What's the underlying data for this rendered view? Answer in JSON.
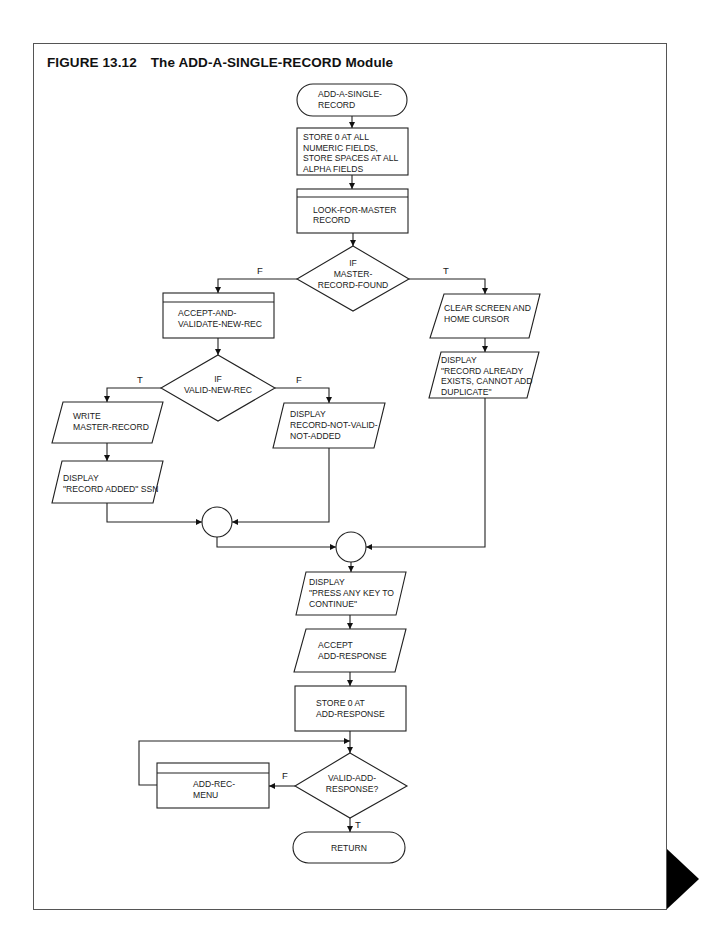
{
  "figure": {
    "number": "FIGURE 13.12",
    "title": "The ADD-A-SINGLE-RECORD Module"
  },
  "flowchart": {
    "start": {
      "type": "terminal",
      "lines": [
        "ADD-A-SINGLE-",
        "RECORD"
      ]
    },
    "init": {
      "type": "process",
      "lines": [
        "STORE 0 AT ALL",
        "NUMERIC  FIELDS,",
        "STORE SPACES AT ALL",
        "ALPHA FIELDS"
      ]
    },
    "look": {
      "type": "predefined-process",
      "lines": [
        "LOOK-FOR-MASTER",
        "RECORD"
      ]
    },
    "found_decision": {
      "type": "decision",
      "lines": [
        "IF",
        "MASTER-",
        "RECORD-FOUND"
      ],
      "false_label": "F",
      "true_label": "T"
    },
    "accept_validate": {
      "type": "predefined-process",
      "lines": [
        "ACCEPT-AND-",
        "VALIDATE-NEW-REC"
      ]
    },
    "clear_screen": {
      "type": "io",
      "lines": [
        "CLEAR SCREEN AND",
        "HOME CURSOR"
      ]
    },
    "display_exists": {
      "type": "io",
      "lines": [
        "DISPLAY",
        "\"RECORD ALREADY",
        "EXISTS, CANNOT ADD",
        "DUPLICATE\""
      ]
    },
    "valid_decision": {
      "type": "decision",
      "lines": [
        "IF",
        "VALID-NEW-REC"
      ],
      "true_label": "T",
      "false_label": "F"
    },
    "write_master": {
      "type": "io",
      "lines": [
        "WRITE",
        "MASTER-RECORD"
      ]
    },
    "display_added": {
      "type": "io",
      "lines": [
        "DISPLAY",
        "\"RECORD ADDED\" SSN"
      ]
    },
    "display_not_valid": {
      "type": "io",
      "lines": [
        "DISPLAY",
        "RECORD-NOT-VALID-",
        "NOT-ADDED"
      ]
    },
    "display_press": {
      "type": "io",
      "lines": [
        "DISPLAY",
        "\"PRESS ANY KEY TO",
        "CONTINUE\""
      ]
    },
    "accept_response": {
      "type": "io",
      "lines": [
        "ACCEPT",
        "ADD-RESPONSE"
      ]
    },
    "store_response": {
      "type": "process",
      "lines": [
        "STORE 0 AT",
        "ADD-RESPONSE"
      ]
    },
    "response_decision": {
      "type": "decision",
      "lines": [
        "VALID-ADD-",
        "RESPONSE?"
      ],
      "false_label": "F",
      "true_label": "T"
    },
    "add_rec_menu": {
      "type": "predefined-process",
      "lines": [
        "ADD-REC-",
        "MENU"
      ]
    },
    "end": {
      "type": "terminal",
      "lines": [
        "RETURN"
      ]
    }
  },
  "colors": {
    "line": "#222222",
    "background": "#ffffff",
    "page_marker": "#000000"
  }
}
